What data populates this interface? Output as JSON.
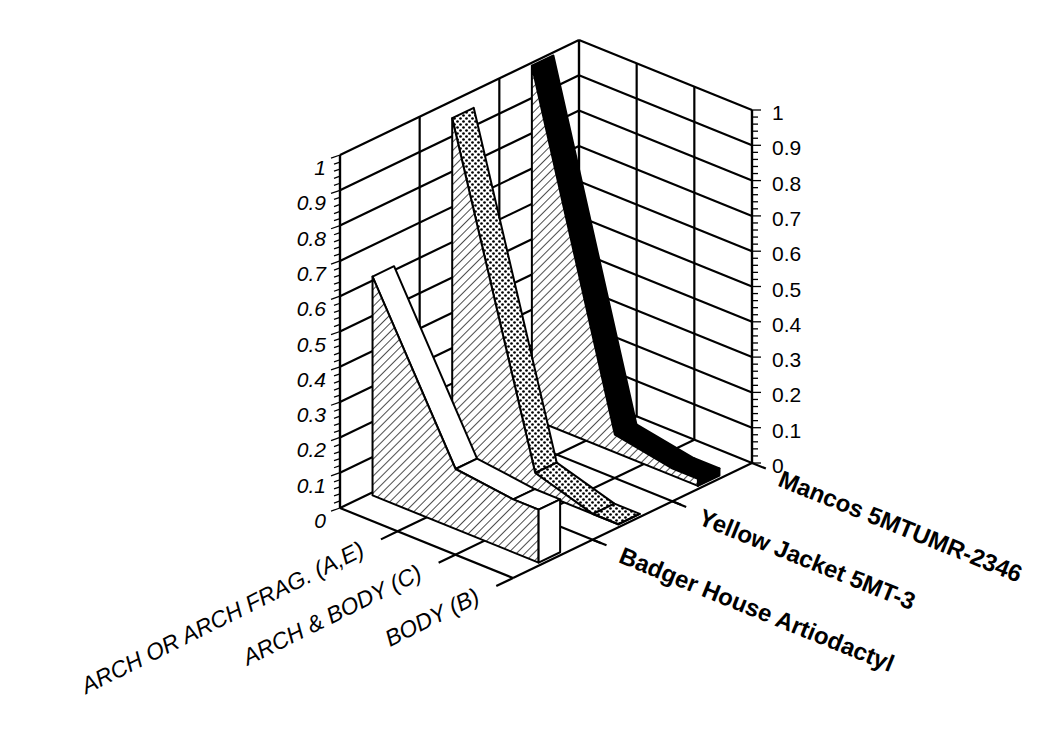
{
  "chart_data": {
    "type": "3d-ribbon",
    "title": "",
    "categories": [
      "ARCH OR ARCH FRAG. (A,E)",
      "ARCH & BODY (C)",
      "BODY (B)"
    ],
    "series": [
      {
        "name": "Badger House Artiodactyl",
        "values": [
          0.62,
          0.17,
          0.15
        ],
        "pattern": "white-top-hatched-side"
      },
      {
        "name": "Yellow Jacket 5MT-3",
        "values": [
          0.96,
          0.05,
          0.0
        ],
        "pattern": "dotted"
      },
      {
        "name": "Mancos 5MTUMR-2346",
        "values": [
          1.0,
          0.05,
          0.02
        ],
        "pattern": "black"
      }
    ],
    "zlabel": "",
    "zlim": [
      0,
      1
    ],
    "z_ticks": [
      "0",
      "0.1",
      "0.2",
      "0.3",
      "0.4",
      "0.5",
      "0.6",
      "0.7",
      "0.8",
      "0.9",
      "1"
    ],
    "grid": true,
    "colors": {
      "line": "#000000",
      "background": "#ffffff",
      "fill_light": "#ffffff",
      "fill_dark": "#000000"
    }
  }
}
